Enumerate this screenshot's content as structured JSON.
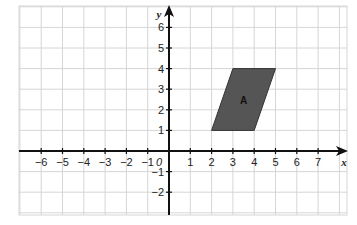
{
  "diagram": {
    "type": "coordinate-grid",
    "x_axis": {
      "label": "x",
      "min": -7,
      "max": 8,
      "tick_labels": [
        "-6",
        "-5",
        "-4",
        "-3",
        "-2",
        "-1",
        "1",
        "2",
        "3",
        "4",
        "5",
        "6",
        "7"
      ]
    },
    "y_axis": {
      "label": "y",
      "min": -3,
      "max": 7,
      "tick_labels": [
        "6",
        "5",
        "4",
        "3",
        "2",
        "1",
        "-1",
        "-2"
      ]
    },
    "origin_label": "0",
    "shapes": [
      {
        "name": "A",
        "kind": "parallelogram",
        "vertices": [
          [
            2,
            1
          ],
          [
            4,
            1
          ],
          [
            5,
            4
          ],
          [
            3,
            4
          ]
        ],
        "fill": "#555555"
      }
    ],
    "colors": {
      "grid": "#d6d6d6",
      "axis": "#111111",
      "shape_fill": "#555555"
    }
  }
}
